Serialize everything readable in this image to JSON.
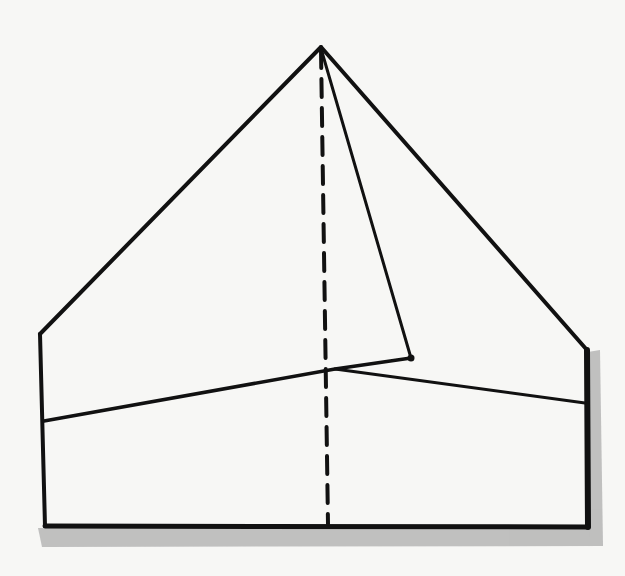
{
  "diagram": {
    "type": "paper-fold-illustration",
    "canvas": {
      "width": 625,
      "height": 576
    },
    "colors": {
      "background": "#f7f7f5",
      "ink": "#111111",
      "shadow": "#b8b8b8"
    },
    "points": {
      "apex": [
        321,
        47
      ],
      "left_shoulder": [
        40,
        334
      ],
      "right_shoulder": [
        587,
        350
      ],
      "bottom_left": [
        45,
        526
      ],
      "bottom_right": [
        588,
        527
      ],
      "fold_tip": [
        411,
        358
      ],
      "fold_crossing": [
        335,
        369
      ],
      "band_left": [
        44,
        421
      ],
      "band_right": [
        585,
        403
      ],
      "center_bottom": [
        328,
        524
      ]
    },
    "labels": []
  }
}
